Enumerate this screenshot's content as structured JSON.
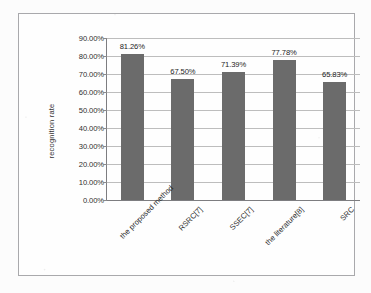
{
  "chart_data": {
    "type": "bar",
    "title": "",
    "xlabel": "",
    "ylabel": "recognition rate",
    "categories": [
      "the proposed method",
      "RSRC[7]",
      "SSEC[7]",
      "the literature[8]",
      "SRC"
    ],
    "values": [
      81.26,
      67.5,
      71.39,
      77.78,
      65.83
    ],
    "value_labels": [
      "81.26%",
      "67.50%",
      "71.39%",
      "77.78%",
      "65.83%"
    ],
    "ylim": [
      0,
      90
    ],
    "ytick_values": [
      0,
      10,
      20,
      30,
      40,
      50,
      60,
      70,
      80,
      90
    ],
    "ytick_labels": [
      "0.00%",
      "10.00%",
      "20.00%",
      "30.00%",
      "40.00%",
      "50.00%",
      "60.00%",
      "70.00%",
      "80.00%",
      "90.00%"
    ],
    "grid": true,
    "legend": "none",
    "bar_color": "#6b6b6b",
    "gridline_color": "#bdbdbd",
    "axis_color": "#7d7d80",
    "frame_color": "#a9a9ac",
    "background_color": "#fefefe",
    "xlabel_rotation": -45
  }
}
